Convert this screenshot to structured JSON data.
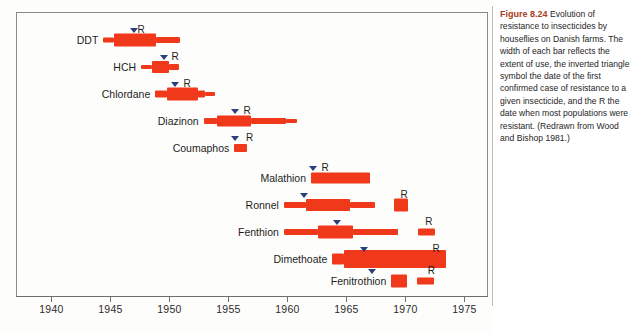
{
  "caption": {
    "figure_number": "Figure 8.24",
    "text": "Evolution of resistance to insecticides by houseflies on Danish farms. The width of each bar reflects the extent of use, the inverted triangle symbol the date of the first confirmed case of resistance to a given insecticide, and the R the date when most populations were resistant. (Redrawn from Wood and Bishop 1981.)"
  },
  "chart_data": {
    "type": "bar",
    "title": "Evolution of resistance to insecticides by houseflies on Danish farms",
    "xlabel": "",
    "ylabel": "",
    "xlim": [
      1937.0,
      1977.0
    ],
    "grid": false,
    "legend": null,
    "axis_ticks": [
      1940,
      1945,
      1950,
      1955,
      1960,
      1965,
      1970,
      1975
    ],
    "tick_labels": [
      "1940",
      "1945",
      "1950",
      "1955",
      "1960",
      "1965",
      "1970",
      "1975"
    ],
    "resistance_label": "R",
    "colors": {
      "bar": "#f0381a",
      "marker": "#2b3f7a",
      "axis": "#6f6f6c",
      "figure_number": "#a83b22"
    },
    "categories": [
      "DDT",
      "HCH",
      "Chlordane",
      "Diazinon",
      "Coumaphos",
      "Malathion",
      "Ronnel",
      "Fenthion",
      "Dimethoate",
      "Fenitrothion"
    ],
    "series": [
      {
        "name": "DDT",
        "use_start": 1944.4,
        "use_end": 1950.9,
        "first_resistance": 1947.0,
        "widespread_resistance": 1947.0,
        "segments": [
          {
            "start": 1944.4,
            "end": 1945.3,
            "thickness": 5
          },
          {
            "start": 1945.3,
            "end": 1948.9,
            "thickness": 13
          },
          {
            "start": 1948.9,
            "end": 1950.9,
            "thickness": 6
          }
        ]
      },
      {
        "name": "HCH",
        "use_start": 1947.6,
        "use_end": 1950.8,
        "first_resistance": 1949.5,
        "widespread_resistance": 1949.9,
        "segments": [
          {
            "start": 1947.6,
            "end": 1948.5,
            "thickness": 4
          },
          {
            "start": 1948.5,
            "end": 1950.0,
            "thickness": 12
          },
          {
            "start": 1950.0,
            "end": 1950.8,
            "thickness": 6
          }
        ]
      },
      {
        "name": "Chlordane",
        "use_start": 1948.8,
        "use_end": 1953.9,
        "first_resistance": 1950.5,
        "widespread_resistance": 1950.9,
        "segments": [
          {
            "start": 1948.8,
            "end": 1949.8,
            "thickness": 7
          },
          {
            "start": 1949.8,
            "end": 1952.4,
            "thickness": 13
          },
          {
            "start": 1952.4,
            "end": 1953.0,
            "thickness": 7
          },
          {
            "start": 1953.0,
            "end": 1953.9,
            "thickness": 4
          }
        ]
      },
      {
        "name": "Diazinon",
        "use_start": 1952.9,
        "use_end": 1960.8,
        "first_resistance": 1955.6,
        "widespread_resistance": 1956.0,
        "segments": [
          {
            "start": 1952.9,
            "end": 1954.0,
            "thickness": 6
          },
          {
            "start": 1954.0,
            "end": 1956.9,
            "thickness": 11
          },
          {
            "start": 1956.9,
            "end": 1959.9,
            "thickness": 6
          },
          {
            "start": 1959.9,
            "end": 1960.8,
            "thickness": 4
          }
        ]
      },
      {
        "name": "Coumaphos",
        "use_start": 1955.5,
        "use_end": 1956.6,
        "first_resistance": 1955.6,
        "widespread_resistance": 1956.2,
        "segments": [
          {
            "start": 1955.5,
            "end": 1956.6,
            "thickness": 8
          }
        ]
      },
      {
        "name": "Malathion",
        "use_start": 1962.0,
        "use_end": 1967.0,
        "first_resistance": 1962.2,
        "widespread_resistance": 1962.6,
        "segments": [
          {
            "start": 1962.0,
            "end": 1967.0,
            "thickness": 11
          }
        ]
      },
      {
        "name": "Ronnel",
        "use_start": 1959.7,
        "use_end": 1967.4,
        "first_resistance": 1961.4,
        "widespread_resistance": 1969.3,
        "segments": [
          {
            "start": 1959.7,
            "end": 1961.6,
            "thickness": 6
          },
          {
            "start": 1961.6,
            "end": 1965.3,
            "thickness": 12
          },
          {
            "start": 1965.3,
            "end": 1967.4,
            "thickness": 6
          },
          {
            "start": 1969.0,
            "end": 1970.2,
            "thickness": 13
          }
        ]
      },
      {
        "name": "Fenthion",
        "use_start": 1959.7,
        "use_end": 1972.1,
        "first_resistance": 1964.2,
        "widespread_resistance": 1971.4,
        "segments": [
          {
            "start": 1959.7,
            "end": 1962.6,
            "thickness": 6
          },
          {
            "start": 1962.6,
            "end": 1965.6,
            "thickness": 13
          },
          {
            "start": 1965.6,
            "end": 1969.4,
            "thickness": 6
          },
          {
            "start": 1971.1,
            "end": 1972.5,
            "thickness": 7
          }
        ]
      },
      {
        "name": "Dimethoate",
        "use_start": 1963.8,
        "use_end": 1973.4,
        "first_resistance": 1966.5,
        "widespread_resistance": 1972.0,
        "segments": [
          {
            "start": 1963.8,
            "end": 1964.8,
            "thickness": 11
          },
          {
            "start": 1964.8,
            "end": 1973.4,
            "thickness": 18
          }
        ]
      },
      {
        "name": "Fenitrothion",
        "use_start": 1968.8,
        "use_end": 1972.0,
        "first_resistance": 1967.2,
        "widespread_resistance": 1971.6,
        "segments": [
          {
            "start": 1968.8,
            "end": 1970.1,
            "thickness": 13
          },
          {
            "start": 1971.0,
            "end": 1972.4,
            "thickness": 7
          }
        ]
      }
    ]
  }
}
